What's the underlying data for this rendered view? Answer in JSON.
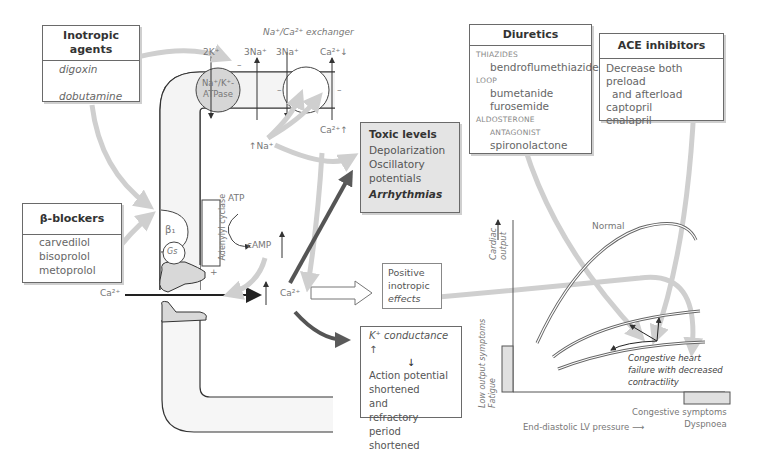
{
  "inotropic_agents": {
    "title_line1": "Inotropic",
    "title_line2": "agents",
    "items": [
      "digoxin",
      "dobutamine"
    ]
  },
  "beta_blockers": {
    "title": "β-blockers",
    "items": [
      "carvedilol",
      "bisoprolol",
      "metoprolol"
    ]
  },
  "diuretics": {
    "title": "Diuretics",
    "groups": [
      {
        "class": "THIAZIDES",
        "drugs": [
          "bendroflumethiazide"
        ]
      },
      {
        "class": "LOOP",
        "drugs": [
          "bumetanide",
          "furosemide"
        ]
      },
      {
        "class": "ALDOSTERONE",
        "class2": "ANTAGONIST",
        "drugs": [
          "spironolactone"
        ]
      }
    ]
  },
  "ace_inhibitors": {
    "title": "ACE inhibitors",
    "line1": "Decrease both preload",
    "line2": "and afterload",
    "items": [
      "captopril",
      "enalapril"
    ]
  },
  "toxic_levels": {
    "title": "Toxic levels",
    "items": [
      "Depolarization",
      "Oscillatory",
      "potentials"
    ],
    "emphasis": "Arrhythmias"
  },
  "positive_inotropic": {
    "lines": [
      "Positive",
      "inotropic",
      "effects"
    ]
  },
  "k_conductance": {
    "title": "K⁺ conductance ↑",
    "arrow": "↓",
    "lines": [
      "Action potential",
      "shortened",
      "and",
      "refractory period",
      "shortened"
    ]
  },
  "cell_labels": {
    "exchanger": "Na⁺/Ca²⁺ exchanger",
    "k2": "2K⁺",
    "na3a": "3Na⁺",
    "na3b": "3Na⁺",
    "ca_top": "Ca²⁺↓",
    "atpase1": "Na⁺/K⁺-",
    "atpase2": "ATPase",
    "ca_in": "Ca²⁺↑",
    "na_in": "↑Na⁺",
    "beta1": "β₁",
    "gs": "Gs",
    "adenylyl": "Adenylyl cyclase",
    "atp": "ATP",
    "camp": "cAMP",
    "plus": "+",
    "ca_ext": "Ca²⁺",
    "ca_cyto": "Ca²⁺",
    "minus": "–"
  },
  "graph": {
    "curve_normal": "Normal",
    "y_axis": "Cardiac output",
    "y_axis_l1": "Cardiac",
    "y_axis_l2": "output",
    "low_output_l1": "Low output symptoms",
    "low_output_l2": "Fatigue",
    "chf_lines": [
      "Congestive heart",
      "failure with decreased",
      "contractility"
    ],
    "congestive_l1": "Congestive symptoms",
    "congestive_l2": "Dyspnoea",
    "x_axis": "End-diastolic LV pressure ⟶"
  }
}
